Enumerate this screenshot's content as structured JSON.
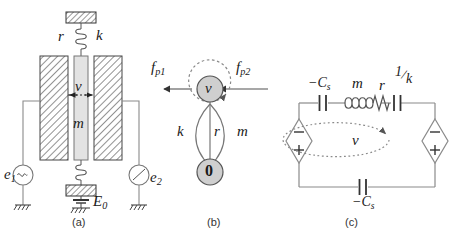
{
  "figure": {
    "panels": [
      {
        "id": "a",
        "caption": "(a)",
        "type": "electrostatic-transducer-schematic",
        "labels": {
          "damping": "r",
          "stiffness": "k",
          "velocity": "v",
          "mass": "m",
          "source_left": "e",
          "source_left_sub": "1",
          "source_right": "e",
          "source_right_sub": "2",
          "bias": "E",
          "bias_sub": "0"
        }
      },
      {
        "id": "b",
        "caption": "(b)",
        "type": "linear-graph",
        "nodes": [
          {
            "name": "v-node",
            "label": "v"
          },
          {
            "name": "ground-node",
            "label": "0"
          }
        ],
        "edges": [
          {
            "name": "stiffness-branch",
            "label": "k"
          },
          {
            "name": "damping-branch",
            "label": "r"
          },
          {
            "name": "inertia-branch",
            "label": "m"
          }
        ],
        "forces": [
          {
            "name": "force-left",
            "label": "f",
            "sub": "p1"
          },
          {
            "name": "force-right",
            "label": "f",
            "sub": "p2"
          }
        ]
      },
      {
        "id": "c",
        "caption": "(c)",
        "type": "equivalent-circuit",
        "components": [
          {
            "name": "capacitor-top-left",
            "label": "−C",
            "sub": "s"
          },
          {
            "name": "inductor",
            "label": "m",
            "sub": ""
          },
          {
            "name": "resistor",
            "label": "r",
            "sub": ""
          },
          {
            "name": "capacitor-inverse-k",
            "num": "1",
            "den": "k"
          },
          {
            "name": "capacitor-bottom",
            "label": "−C",
            "sub": "s"
          }
        ],
        "sources": [
          {
            "name": "source-left",
            "plus": "+",
            "minus": "−"
          },
          {
            "name": "source-right",
            "plus": "+",
            "minus": "−"
          }
        ],
        "loop": {
          "name": "mesh-current-loop",
          "label": "v"
        }
      }
    ]
  },
  "colors": {
    "ink": "#1a1a1a",
    "wire": "#8a8a8a",
    "hatch": "#6d6d6d",
    "fill_light": "#e3e3e3",
    "fill_node": "#cfcfcf",
    "dashed": "#8a8a8a"
  }
}
